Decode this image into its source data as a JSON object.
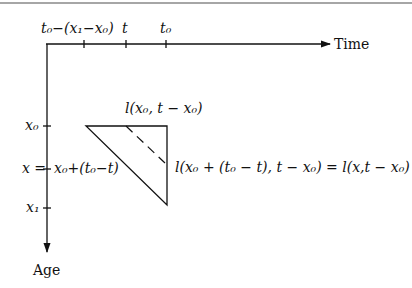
{
  "diagram": {
    "type": "Lexis-style age-time diagram",
    "axes": {
      "horizontal": {
        "label": "Time",
        "ticks": [
          "t₀−(x₁−x₀)",
          "t",
          "t₀"
        ]
      },
      "vertical": {
        "label": "Age",
        "ticks": [
          "x₀",
          "x = x₀+(t₀−t)",
          "x₁"
        ]
      }
    },
    "labels": {
      "time_axis": "Time",
      "age_axis": "Age",
      "tick_t0_minus": "t₀−(x₁−x₀)",
      "tick_t": "t",
      "tick_t0": "t₀",
      "tick_x0": "x₀",
      "tick_x_eq": "x =",
      "tick_x_expr": "x₀+(t₀−t)",
      "tick_x1": "x₁",
      "top_edge": "l(x₀, t − x₀)",
      "right_edge": "l(x₀ + (t₀ − t), t − x₀) = l(x,t − x₀)"
    },
    "colors": {
      "line": "#111111",
      "border": "#888888"
    }
  }
}
